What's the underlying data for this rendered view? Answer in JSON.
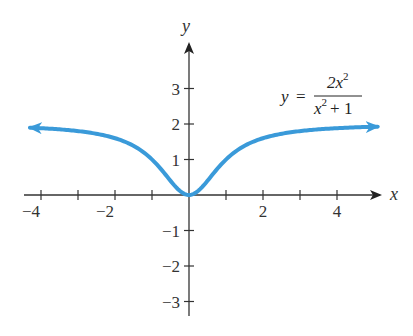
{
  "chart_data": {
    "type": "line",
    "title": "",
    "function": "y = 2x^2 / (x^2 + 1)",
    "equation_label": {
      "lhs": "y",
      "equals": "=",
      "numerator": "2x",
      "numerator_exp": "2",
      "denominator": "x",
      "denominator_exp": "2",
      "denominator_rest": "+ 1"
    },
    "xlabel": "x",
    "ylabel": "y",
    "xlim": [
      -4.3,
      5.1
    ],
    "ylim": [
      -3.3,
      4
    ],
    "x_ticks": [
      -4,
      -3,
      -2,
      -1,
      1,
      2,
      3,
      4
    ],
    "x_tick_labels": [
      "−4",
      "−2",
      "2",
      "4"
    ],
    "x_tick_label_values": [
      -4,
      -2,
      2,
      4
    ],
    "y_ticks": [
      -3,
      -2,
      -1,
      1,
      2,
      3
    ],
    "y_tick_labels": [
      "−3",
      "−2",
      "−1",
      "1",
      "2",
      "3"
    ],
    "y_tick_label_values": [
      -3,
      -2,
      -1,
      1,
      2,
      3
    ],
    "grid": false,
    "series": [
      {
        "name": "y = 2x^2/(x^2+1)",
        "color": "#3a9ad9",
        "arrows_both_ends": true,
        "x": [
          -4.3,
          -4,
          -3,
          -2,
          -1.5,
          -1,
          -0.5,
          0,
          0.5,
          1,
          1.5,
          2,
          3,
          4,
          5.1
        ],
        "y": [
          1.897,
          1.882,
          1.8,
          1.6,
          1.385,
          1.0,
          0.4,
          0.0,
          0.4,
          1.0,
          1.385,
          1.6,
          1.8,
          1.882,
          1.926
        ]
      }
    ],
    "asymptote_note": "approaches y = 2 as x → ±∞"
  },
  "style": {
    "curve_color": "#3a9ad9",
    "axis_color": "#333333"
  }
}
